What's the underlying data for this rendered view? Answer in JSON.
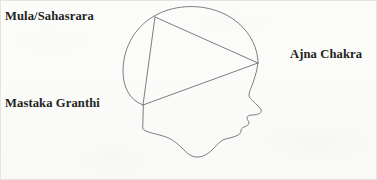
{
  "figure": {
    "background_color": "#fbfbfa",
    "line_color": "#6f6f72",
    "text_color": "#231f1d",
    "border_color": "#e2e2e0"
  },
  "labels": {
    "top_left": "Mula/Sahasrara",
    "bottom_left": "Mastaka Granthi",
    "right": "Ajna Chakra"
  },
  "points": {
    "mula_sahasrara": {
      "x": 155,
      "y": 17,
      "label": "Mula/Sahasrara"
    },
    "mastaka_granthi": {
      "x": 143,
      "y": 105,
      "label": "Mastaka Granthi"
    },
    "ajna_chakra": {
      "x": 258,
      "y": 63,
      "label": "Ajna Chakra"
    }
  },
  "triangle": {
    "edges": [
      {
        "from": "mula_sahasrara",
        "to": "ajna_chakra"
      },
      {
        "from": "ajna_chakra",
        "to": "mastaka_granthi"
      },
      {
        "from": "mastaka_granthi",
        "to": "mula_sahasrara"
      }
    ]
  }
}
